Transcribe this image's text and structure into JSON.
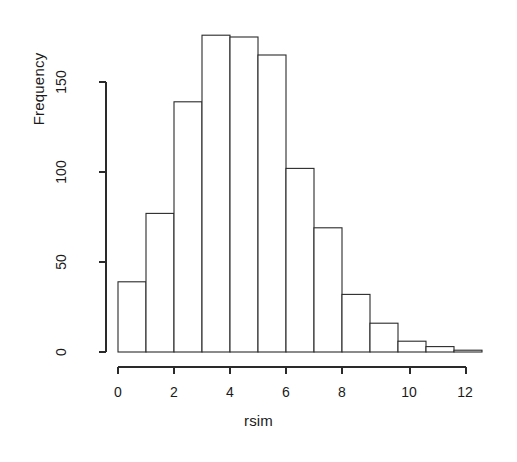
{
  "chart_data": {
    "type": "bar",
    "subtype": "histogram",
    "title": "",
    "xlabel": "rsim",
    "ylabel": "Frequency",
    "bin_width": 1,
    "bin_edges": [
      0,
      1,
      2,
      3,
      4,
      5,
      6,
      7,
      8,
      9,
      10,
      11,
      12,
      13
    ],
    "categories": [
      "0-1",
      "1-2",
      "2-3",
      "3-4",
      "4-5",
      "5-6",
      "6-7",
      "7-8",
      "8-9",
      "9-10",
      "10-11",
      "11-12",
      "12-13"
    ],
    "values": [
      39,
      77,
      139,
      176,
      175,
      165,
      102,
      69,
      32,
      16,
      6,
      3,
      1
    ],
    "xlim": [
      0,
      13
    ],
    "ylim": [
      0,
      180
    ],
    "xticks": [
      0,
      2,
      4,
      6,
      8,
      10,
      12
    ],
    "xtick_labels": [
      "0",
      "2",
      "4",
      "6",
      "8",
      "10",
      "12"
    ],
    "yticks": [
      0,
      50,
      100,
      150
    ],
    "ytick_labels": [
      "0",
      "50",
      "100",
      "150"
    ],
    "grid": false,
    "legend": null,
    "bar_fill_color": "#ffffff",
    "bar_edge_color": "#2a2a2a",
    "background_color": "#ffffff"
  }
}
